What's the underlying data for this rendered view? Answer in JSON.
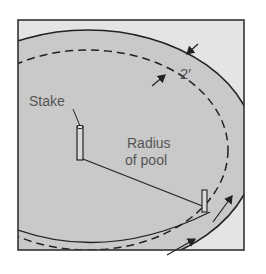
{
  "figure": {
    "labels": {
      "stake": "Stake",
      "radius_line1": "Radius",
      "radius_line2": "of pool",
      "offset": "2′"
    },
    "colors": {
      "background": "#ffffff",
      "outside_pool": "#e4e4e4",
      "pool_fill": "#c9c9c9",
      "line": "#222222",
      "label_text": "#555555"
    }
  }
}
